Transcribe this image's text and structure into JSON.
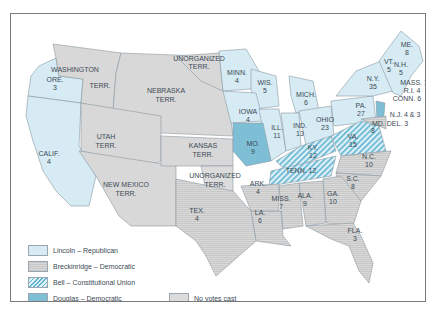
{
  "map": {
    "title": "Election of 1860",
    "colors": {
      "lincoln": "#d6ebf4",
      "breckinridge": "#d2d2d2",
      "bell_stripe": "#5fb3d0",
      "douglas": "#7fbfd6",
      "no_votes": "#dcdcdc",
      "border": "#8fa2ad"
    },
    "territories": [
      {
        "name": "WASHINGTON",
        "sub": "",
        "status": "no_votes"
      },
      {
        "name": "TERR.",
        "sub": "",
        "status": "no_votes"
      },
      {
        "name": "UNORGANIZED",
        "sub": "TERR.",
        "status": "no_votes"
      },
      {
        "name": "NEBRASKA",
        "sub": "TERR.",
        "status": "no_votes"
      },
      {
        "name": "UTAH",
        "sub": "TERR.",
        "status": "no_votes"
      },
      {
        "name": "KANSAS",
        "sub": "TERR.",
        "status": "no_votes"
      },
      {
        "name": "NEW MEXICO",
        "sub": "TERR.",
        "status": "no_votes"
      },
      {
        "name": "UNORGANIZED",
        "sub": "TERR.",
        "status": "no_votes"
      }
    ],
    "states": [
      {
        "abbr": "ORE.",
        "votes": "3",
        "winner": "lincoln"
      },
      {
        "abbr": "CALIF.",
        "votes": "4",
        "winner": "lincoln"
      },
      {
        "abbr": "MINN.",
        "votes": "4",
        "winner": "lincoln"
      },
      {
        "abbr": "WIS.",
        "votes": "5",
        "winner": "lincoln"
      },
      {
        "abbr": "IOWA",
        "votes": "4",
        "winner": "lincoln"
      },
      {
        "abbr": "MICH.",
        "votes": "6",
        "winner": "lincoln"
      },
      {
        "abbr": "ILL.",
        "votes": "11",
        "winner": "lincoln"
      },
      {
        "abbr": "IND.",
        "votes": "13",
        "winner": "lincoln"
      },
      {
        "abbr": "OHIO",
        "votes": "23",
        "winner": "lincoln"
      },
      {
        "abbr": "PA.",
        "votes": "27",
        "winner": "lincoln"
      },
      {
        "abbr": "N.Y.",
        "votes": "35",
        "winner": "lincoln"
      },
      {
        "abbr": "VT.",
        "votes": "5",
        "winner": "lincoln"
      },
      {
        "abbr": "N.H.",
        "votes": "5",
        "winner": "lincoln"
      },
      {
        "abbr": "ME.",
        "votes": "8",
        "winner": "lincoln"
      },
      {
        "abbr": "MASS.",
        "votes": "13",
        "winner": "lincoln"
      },
      {
        "abbr": "R.I.",
        "votes": "4",
        "winner": "lincoln"
      },
      {
        "abbr": "CONN.",
        "votes": "6",
        "winner": "lincoln"
      },
      {
        "abbr": "N.J.",
        "votes": "4 & 3",
        "winner": "lincoln/douglas"
      },
      {
        "abbr": "MO.",
        "votes": "9",
        "winner": "douglas"
      },
      {
        "abbr": "KY.",
        "votes": "12",
        "winner": "bell"
      },
      {
        "abbr": "VA.",
        "votes": "15",
        "winner": "bell"
      },
      {
        "abbr": "TENN.",
        "votes": "12",
        "winner": "bell"
      },
      {
        "abbr": "MD.",
        "votes": "8",
        "winner": "breckinridge"
      },
      {
        "abbr": "DEL.",
        "votes": "3",
        "winner": "breckinridge"
      },
      {
        "abbr": "N.C.",
        "votes": "10",
        "winner": "breckinridge"
      },
      {
        "abbr": "S.C.",
        "votes": "8",
        "winner": "breckinridge"
      },
      {
        "abbr": "GA.",
        "votes": "10",
        "winner": "breckinridge"
      },
      {
        "abbr": "ALA.",
        "votes": "9",
        "winner": "breckinridge"
      },
      {
        "abbr": "MISS.",
        "votes": "7",
        "winner": "breckinridge"
      },
      {
        "abbr": "LA.",
        "votes": "6",
        "winner": "breckinridge"
      },
      {
        "abbr": "ARK.",
        "votes": "4",
        "winner": "breckinridge"
      },
      {
        "abbr": "TEX.",
        "votes": "4",
        "winner": "breckinridge"
      },
      {
        "abbr": "FLA.",
        "votes": "3",
        "winner": "breckinridge"
      }
    ],
    "labels": {
      "washington": "WASHINGTON",
      "terr": "TERR.",
      "unorg_n": "UNORGANIZED",
      "unorg_n2": "TERR.",
      "nebraska": "NEBRASKA",
      "nebraska2": "TERR.",
      "utah": "UTAH",
      "utah2": "TERR.",
      "kansas": "KANSAS",
      "kansas2": "TERR.",
      "newmexico": "NEW MEXICO",
      "newmexico2": "TERR.",
      "unorg_s": "UNORGANIZED",
      "unorg_s2": "TERR.",
      "ore": "ORE.",
      "ore_v": "3",
      "calif": "CALIF.",
      "calif_v": "4",
      "minn": "MINN.",
      "minn_v": "4",
      "wis": "WIS.",
      "wis_v": "5",
      "iowa": "IOWA",
      "iowa_v": "4",
      "mich": "MICH.",
      "mich_v": "6",
      "ill": "ILL.",
      "ill_v": "11",
      "ind": "IND.",
      "ind_v": "13",
      "ohio": "OHIO",
      "ohio_v": "23",
      "pa": "PA.",
      "pa_v": "27",
      "ny": "N.Y.",
      "ny_v": "35",
      "vt": "VT.",
      "vt_v": "5",
      "nh": "N.H.",
      "nh_v": "5",
      "me": "ME.",
      "me_v": "8",
      "mass": "MASS. 13",
      "ri": "R.I. 4",
      "conn": "CONN. 6",
      "nj": "N.J. 4 & 3",
      "mddel": "MD. DEL. 3",
      "md_v": "8",
      "mo": "MO.",
      "mo_v": "9",
      "ky": "KY.",
      "ky_v": "12",
      "va": "VA.",
      "va_v": "15",
      "tenn": "TENN. 12",
      "nc": "N.C.",
      "nc_v": "10",
      "sc": "S.C.",
      "sc_v": "8",
      "ga": "GA.",
      "ga_v": "10",
      "ala": "ALA.",
      "ala_v": "9",
      "miss": "MISS.",
      "miss_v": "7",
      "la": "LA.",
      "la_v": "6",
      "ark": "ARK.",
      "ark_v": "4",
      "tex": "TEX.",
      "tex_v": "4",
      "fla": "FLA.",
      "fla_v": "3"
    }
  },
  "legend": {
    "items": [
      {
        "key": "lincoln",
        "label": "Lincoln – Republican"
      },
      {
        "key": "breckinridge",
        "label": "Breckinridge – Democratic"
      },
      {
        "key": "bell",
        "label": "Bell – Constitutional Union"
      },
      {
        "key": "douglas",
        "label": "Douglas – Democratic"
      },
      {
        "key": "no_votes",
        "label": "No votes cast"
      }
    ]
  }
}
